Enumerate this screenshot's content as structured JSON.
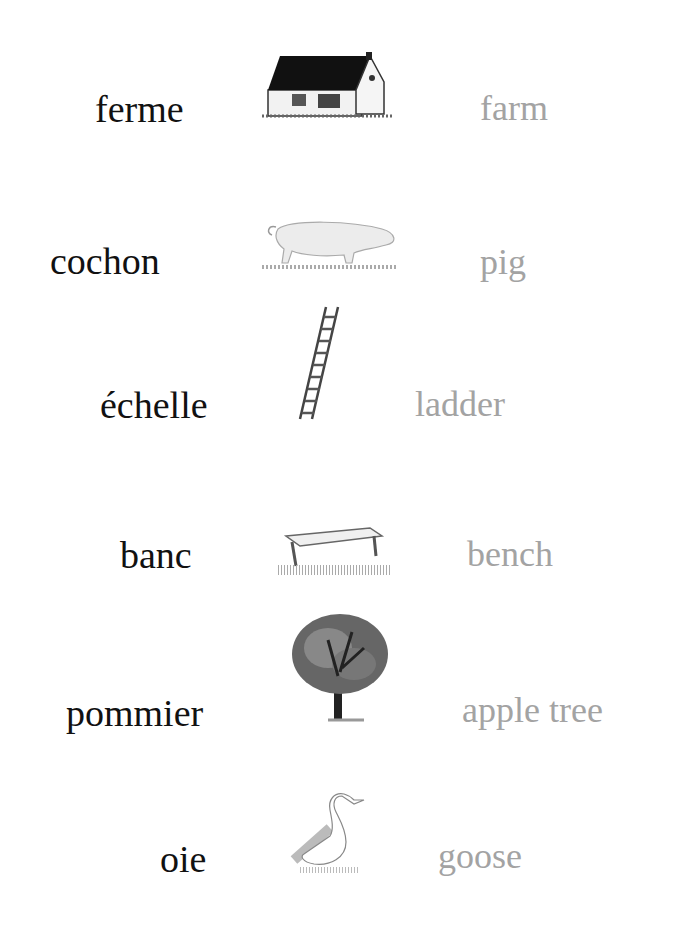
{
  "colors": {
    "french_text": "#111111",
    "english_text": "#a3a3a3",
    "background": "#ffffff"
  },
  "entries": [
    {
      "french": "ferme",
      "english": "farm",
      "icon": "farmhouse-icon"
    },
    {
      "french": "cochon",
      "english": "pig",
      "icon": "pig-icon"
    },
    {
      "french": "échelle",
      "english": "ladder",
      "icon": "ladder-icon"
    },
    {
      "french": "banc",
      "english": "bench",
      "icon": "bench-icon"
    },
    {
      "french": "pommier",
      "english": "apple tree",
      "icon": "apple-tree-icon"
    },
    {
      "french": "oie",
      "english": "goose",
      "icon": "goose-icon"
    }
  ]
}
